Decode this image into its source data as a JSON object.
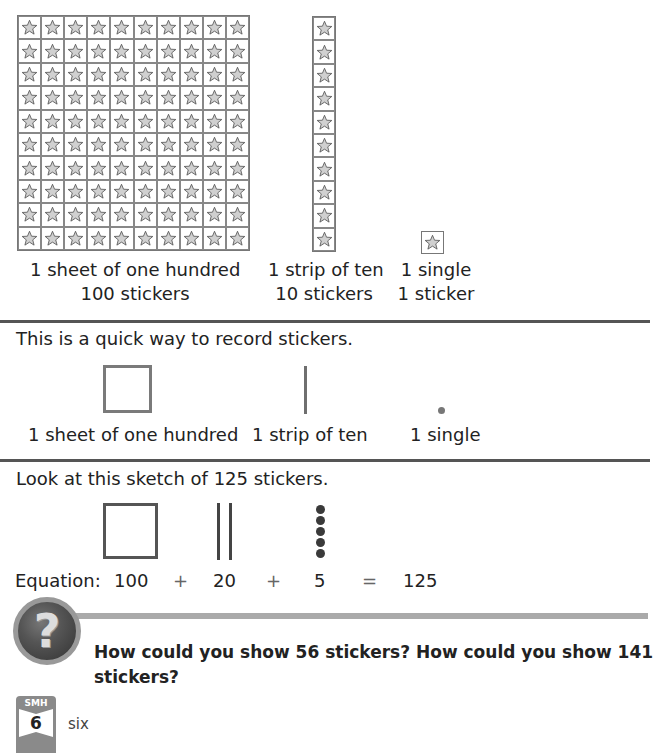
{
  "models": {
    "hundred": {
      "rows": 10,
      "cols": 10,
      "label_line1": "1 sheet of one hundred",
      "label_line2": "100 stickers"
    },
    "ten": {
      "count": 10,
      "label_line1": "1 strip of ten",
      "label_line2": "10 stickers"
    },
    "one": {
      "count": 1,
      "label_line1": "1 single",
      "label_line2": "1 sticker"
    },
    "icon": "star-icon"
  },
  "quick_record": {
    "intro": "This is a quick way to record stickers.",
    "hundred_label": "1 sheet of one hundred",
    "ten_label": "1 strip of ten",
    "one_label": "1 single"
  },
  "sketch": {
    "intro": "Look at this sketch of 125 stickers.",
    "hundreds": 1,
    "tens": 2,
    "ones": 5,
    "equation": {
      "label": "Equation:",
      "term1": "100",
      "op1": "+",
      "term2": "20",
      "op2": "+",
      "term3": "5",
      "eq": "=",
      "result": "125"
    }
  },
  "question": {
    "icon": "question-mark-icon",
    "text": "How could you show 56 stickers? How could you show 141 stickers?"
  },
  "footer": {
    "badge_label": "SMH",
    "page_number": "6",
    "page_word": "six"
  },
  "colors": {
    "divider": "#555555",
    "band": "#aaaaaa",
    "star_fill": "#d0d0d0"
  }
}
